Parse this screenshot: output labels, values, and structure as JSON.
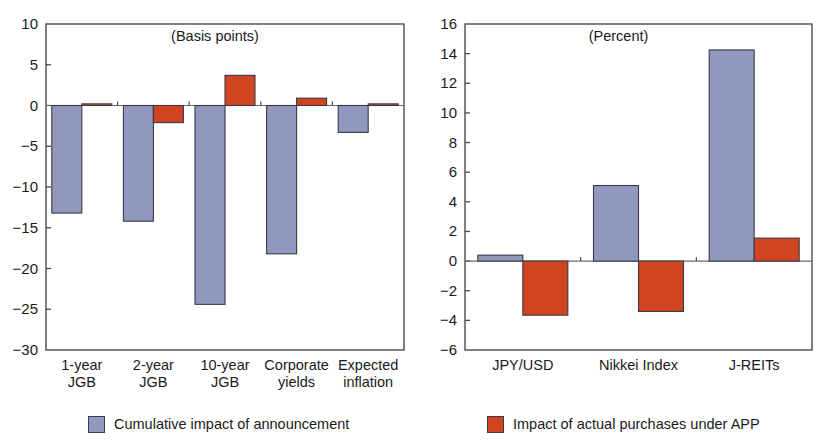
{
  "figure": {
    "legend": [
      {
        "key": "announcement",
        "label": "Cumulative impact of announcement",
        "color": "#9098c0",
        "icon": "blue-square-swatch"
      },
      {
        "key": "purchases",
        "label": "Impact of actual purchases under APP",
        "color": "#d0451f",
        "icon": "red-square-swatch"
      }
    ]
  },
  "chart_data": [
    {
      "type": "bar",
      "panel": "left",
      "title": "(Basis points)",
      "xlabel": "",
      "ylabel": "",
      "ylim": [
        -30,
        10
      ],
      "yticks": [
        10,
        5,
        0,
        -5,
        -10,
        -15,
        -20,
        -25,
        -30
      ],
      "ytick_labels": [
        "10",
        "5",
        "0",
        "−5",
        "−10",
        "−15",
        "−20",
        "−25",
        "−30"
      ],
      "grid": false,
      "legend_position": "below-left",
      "categories": [
        "1-year JGB",
        "2-year JGB",
        "10-year JGB",
        "Corporate yields",
        "Expected inflation"
      ],
      "category_lines": [
        [
          "1-year",
          "JGB"
        ],
        [
          "2-year",
          "JGB"
        ],
        [
          "10-year",
          "JGB"
        ],
        [
          "Corporate",
          "yields"
        ],
        [
          "Expected",
          "inflation"
        ]
      ],
      "series": [
        {
          "name": "Cumulative impact of announcement",
          "color": "#9098c0",
          "values": [
            -13.2,
            -14.2,
            -24.4,
            -18.2,
            -3.3
          ]
        },
        {
          "name": "Impact of actual purchases under APP",
          "color": "#d0451f",
          "values": [
            0.2,
            -2.1,
            3.7,
            0.9,
            0.2
          ]
        }
      ]
    },
    {
      "type": "bar",
      "panel": "right",
      "title": "(Percent)",
      "xlabel": "",
      "ylabel": "",
      "ylim": [
        -6,
        16
      ],
      "yticks": [
        16,
        14,
        12,
        10,
        8,
        6,
        4,
        2,
        0,
        -2,
        -4,
        -6
      ],
      "ytick_labels": [
        "16",
        "14",
        "12",
        "10",
        "8",
        "6",
        "4",
        "2",
        "0",
        "−2",
        "−4",
        "−6"
      ],
      "grid": false,
      "legend_position": "below-left",
      "categories": [
        "JPY/USD",
        "Nikkei Index",
        "J-REITs"
      ],
      "category_lines": [
        [
          "JPY/USD"
        ],
        [
          "Nikkei Index"
        ],
        [
          "J-REITs"
        ]
      ],
      "series": [
        {
          "name": "Cumulative impact of announcement",
          "color": "#9098c0",
          "values": [
            0.4,
            5.1,
            14.25
          ]
        },
        {
          "name": "Impact of actual purchases under APP",
          "color": "#d0451f",
          "values": [
            -3.65,
            -3.4,
            1.55
          ]
        }
      ]
    }
  ]
}
